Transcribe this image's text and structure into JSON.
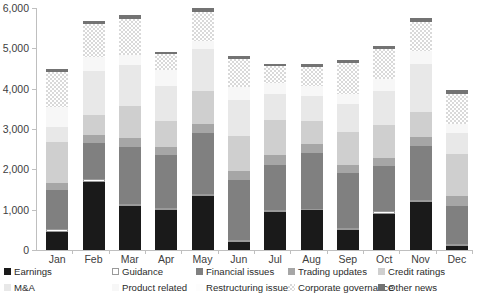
{
  "chart_data": {
    "type": "bar",
    "stacked": true,
    "title": "",
    "xlabel": "",
    "ylabel": "",
    "ylim": [
      0,
      6000
    ],
    "ytick_labels": [
      "0",
      "1,000",
      "2,000",
      "3,000",
      "4,000",
      "5,000",
      "6,000"
    ],
    "ytick_values": [
      0,
      1000,
      2000,
      3000,
      4000,
      5000,
      6000
    ],
    "grid": false,
    "legend_position": "bottom",
    "categories": [
      "Jan",
      "Feb",
      "Mar",
      "Apr",
      "May",
      "Jun",
      "Jul",
      "Aug",
      "Sep",
      "Oct",
      "Nov",
      "Dec"
    ],
    "series": [
      {
        "name": "Earnings",
        "color": "#1a1a1a",
        "pattern": "solid",
        "values": [
          440,
          1690,
          1090,
          980,
          1350,
          210,
          950,
          990,
          490,
          900,
          1180,
          100
        ]
      },
      {
        "name": "Guidance",
        "color": "#ffffff",
        "pattern": "outline",
        "values": [
          70,
          60,
          40,
          50,
          30,
          40,
          50,
          30,
          60,
          60,
          70,
          40
        ]
      },
      {
        "name": "Financial issues",
        "color": "#808080",
        "pattern": "solid",
        "values": [
          970,
          910,
          1430,
          1320,
          1520,
          1480,
          1100,
          1390,
          1360,
          1120,
          1340,
          960
        ]
      },
      {
        "name": "Trading updates",
        "color": "#a6a6a6",
        "pattern": "solid",
        "values": [
          190,
          200,
          210,
          200,
          220,
          230,
          250,
          220,
          200,
          210,
          220,
          240
        ]
      },
      {
        "name": "Credit ratings",
        "color": "#cfcfcf",
        "pattern": "solid",
        "values": [
          1000,
          480,
          810,
          660,
          830,
          860,
          880,
          570,
          810,
          820,
          620,
          1050
        ]
      },
      {
        "name": "M&A",
        "color": "#e8e8e8",
        "pattern": "solid",
        "values": [
          370,
          1090,
          1000,
          860,
          1030,
          900,
          640,
          620,
          700,
          830,
          1190,
          510
        ]
      },
      {
        "name": "Product related",
        "color": "#f7f7f7",
        "pattern": "solid",
        "values": [
          500,
          360,
          260,
          400,
          200,
          330,
          270,
          240,
          260,
          310,
          320,
          230
        ]
      },
      {
        "name": "Restructuring issues",
        "color": "#fdfdfd",
        "pattern": "solid",
        "values": [
          0,
          0,
          0,
          0,
          0,
          0,
          0,
          0,
          0,
          0,
          0,
          0
        ]
      },
      {
        "name": "Corporate governance",
        "color": "#d9d9d9",
        "pattern": "checker",
        "values": [
          880,
          810,
          900,
          380,
          720,
          680,
          420,
          480,
          760,
          740,
          720,
          740
        ]
      },
      {
        "name": "Other news",
        "color": "#737373",
        "pattern": "solid",
        "values": [
          70,
          90,
          80,
          50,
          90,
          90,
          60,
          70,
          80,
          70,
          90,
          90
        ]
      }
    ]
  },
  "axis": {
    "y_labels": [
      "6,000",
      "5,000",
      "4,000",
      "3,000",
      "2,000",
      "1,000",
      "0"
    ],
    "x_labels": [
      "Jan",
      "Feb",
      "Mar",
      "Apr",
      "May",
      "Jun",
      "Jul",
      "Aug",
      "Sep",
      "Oct",
      "Nov",
      "Dec"
    ]
  },
  "legend": {
    "items": [
      {
        "label": "Earnings",
        "color": "#1a1a1a",
        "pattern": "solid"
      },
      {
        "label": "Guidance",
        "color": "#ffffff",
        "pattern": "outline"
      },
      {
        "label": "Financial issues",
        "color": "#808080",
        "pattern": "solid"
      },
      {
        "label": "Trading updates",
        "color": "#a6a6a6",
        "pattern": "solid"
      },
      {
        "label": "Credit ratings",
        "color": "#cfcfcf",
        "pattern": "solid"
      },
      {
        "label": "M&A",
        "color": "#e8e8e8",
        "pattern": "solid"
      },
      {
        "label": "Product related",
        "color": "#f7f7f7",
        "pattern": "solid"
      },
      {
        "label": "Restructuring issues",
        "color": "#fdfdfd",
        "pattern": "solid"
      },
      {
        "label": "Corporate governance",
        "color": "#d9d9d9",
        "pattern": "checker"
      },
      {
        "label": "Other news",
        "color": "#737373",
        "pattern": "solid"
      }
    ]
  }
}
